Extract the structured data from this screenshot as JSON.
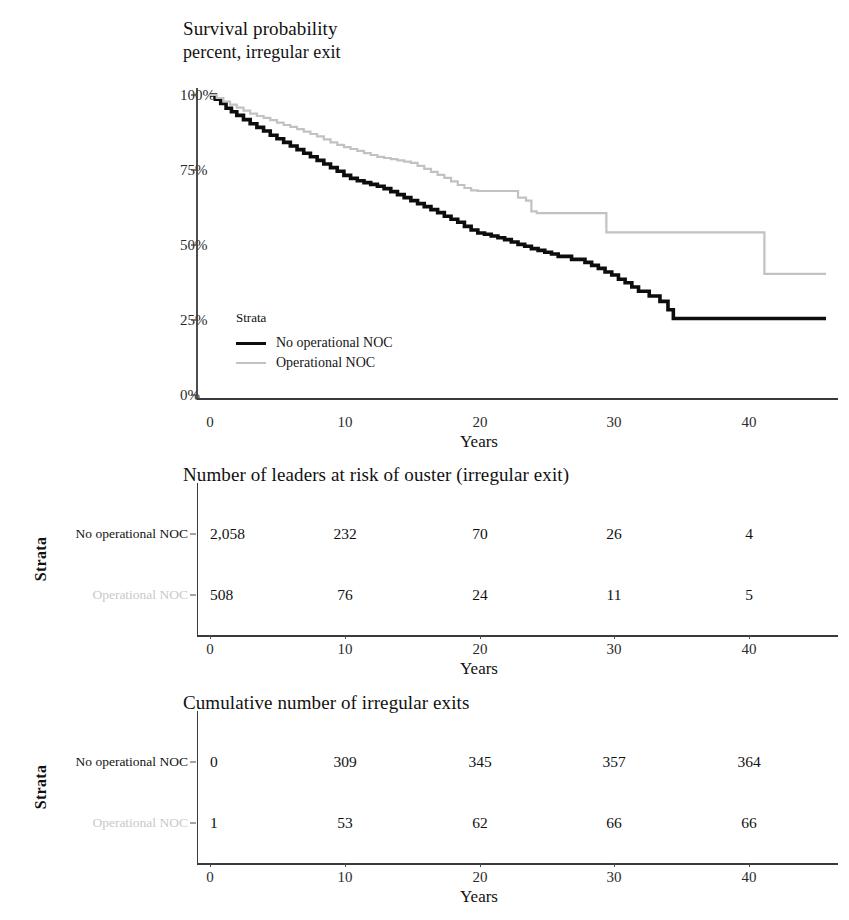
{
  "figure": {
    "background": "#ffffff",
    "series_colors": {
      "no_operational_noc": "#0d0d0d",
      "operational_noc": "#c2c2c2"
    }
  },
  "survival_panel": {
    "title_line1": "Survival probability",
    "title_line2": "percent, irregular exit",
    "x_axis_title": "Years",
    "y_ticks": [
      "100%",
      "75%",
      "50%",
      "25%",
      "0%"
    ],
    "x_ticks": [
      "0",
      "10",
      "20",
      "30",
      "40"
    ],
    "legend": {
      "title": "Strata",
      "items": [
        {
          "label": "No operational NOC",
          "color": "#0d0d0d"
        },
        {
          "label": "Operational NOC",
          "color": "#c2c2c2"
        }
      ]
    }
  },
  "risk_panel": {
    "title": "Number of leaders at risk of ouster (irregular exit)",
    "strata_axis_label": "Strata",
    "x_axis_title": "Years",
    "x_ticks": [
      "0",
      "10",
      "20",
      "30",
      "40"
    ],
    "rows": [
      {
        "label": "No operational NOC",
        "color": "#121212",
        "values": [
          "2,058",
          "232",
          "70",
          "26",
          "4"
        ]
      },
      {
        "label": "Operational NOC",
        "color": "#c9c9c9",
        "values": [
          "508",
          "76",
          "24",
          "11",
          "5"
        ]
      }
    ]
  },
  "cumulative_panel": {
    "title": "Cumulative number of irregular exits",
    "strata_axis_label": "Strata",
    "x_axis_title": "Years",
    "x_ticks": [
      "0",
      "10",
      "20",
      "30",
      "40"
    ],
    "rows": [
      {
        "label": "No operational NOC",
        "color": "#121212",
        "values": [
          "0",
          "309",
          "345",
          "357",
          "364"
        ]
      },
      {
        "label": "Operational NOC",
        "color": "#c9c9c9",
        "values": [
          "1",
          "53",
          "62",
          "66",
          "66"
        ]
      }
    ]
  },
  "chart_data": {
    "type": "line",
    "title": "Survival probability",
    "subtitle": "percent, irregular exit",
    "xlabel": "Years",
    "ylabel": "Survival probability percent, irregular exit",
    "xlim": [
      0,
      46
    ],
    "ylim": [
      0,
      100
    ],
    "xticks": [
      0,
      10,
      20,
      30,
      40
    ],
    "yticks": [
      0,
      25,
      50,
      75,
      100
    ],
    "ytick_labels": [
      "0%",
      "25%",
      "50%",
      "75%",
      "100%"
    ],
    "grid": false,
    "legend_position": "inside-lower-left",
    "legend_title": "Strata",
    "step": "post",
    "series": [
      {
        "name": "No operational NOC",
        "color": "#0d0d0d",
        "points": [
          [
            0,
            100
          ],
          [
            0.4,
            98.6
          ],
          [
            0.8,
            97.2
          ],
          [
            1.2,
            95.6
          ],
          [
            1.6,
            94.4
          ],
          [
            2.0,
            93.2
          ],
          [
            2.5,
            91.8
          ],
          [
            3.0,
            90.4
          ],
          [
            3.5,
            89.2
          ],
          [
            4.0,
            88.0
          ],
          [
            4.5,
            86.6
          ],
          [
            5.0,
            85.4
          ],
          [
            5.5,
            84.2
          ],
          [
            6.0,
            83.0
          ],
          [
            6.5,
            81.8
          ],
          [
            7.0,
            80.6
          ],
          [
            7.5,
            79.4
          ],
          [
            8.0,
            78.2
          ],
          [
            8.5,
            77.0
          ],
          [
            9.0,
            75.8
          ],
          [
            9.5,
            74.6
          ],
          [
            10.0,
            73.2
          ],
          [
            10.5,
            72.2
          ],
          [
            11.0,
            71.4
          ],
          [
            11.5,
            70.8
          ],
          [
            12.0,
            70.2
          ],
          [
            12.5,
            69.6
          ],
          [
            13.0,
            68.8
          ],
          [
            13.5,
            67.8
          ],
          [
            14.0,
            66.8
          ],
          [
            14.5,
            65.8
          ],
          [
            15.0,
            64.8
          ],
          [
            15.5,
            63.8
          ],
          [
            16.0,
            62.8
          ],
          [
            16.5,
            61.8
          ],
          [
            17.0,
            60.8
          ],
          [
            17.5,
            59.6
          ],
          [
            18.0,
            58.6
          ],
          [
            18.5,
            57.6
          ],
          [
            19.0,
            56.2
          ],
          [
            19.5,
            55.0
          ],
          [
            20.0,
            54.0
          ],
          [
            20.5,
            53.6
          ],
          [
            21.0,
            53.0
          ],
          [
            21.5,
            52.4
          ],
          [
            22.0,
            51.8
          ],
          [
            22.5,
            51.0
          ],
          [
            23.0,
            50.2
          ],
          [
            23.5,
            49.6
          ],
          [
            24.0,
            48.8
          ],
          [
            24.5,
            48.2
          ],
          [
            25.0,
            47.6
          ],
          [
            25.5,
            47.0
          ],
          [
            26.0,
            46.2
          ],
          [
            27.0,
            45.2
          ],
          [
            28.0,
            44.2
          ],
          [
            28.5,
            43.2
          ],
          [
            29.0,
            42.2
          ],
          [
            29.5,
            41.0
          ],
          [
            30.0,
            40.0
          ],
          [
            30.5,
            38.6
          ],
          [
            31.0,
            37.4
          ],
          [
            31.5,
            36.0
          ],
          [
            32.0,
            34.6
          ],
          [
            32.8,
            33.0
          ],
          [
            33.6,
            31.2
          ],
          [
            34.2,
            28.4
          ],
          [
            34.6,
            25.5
          ],
          [
            46.0,
            25.5
          ]
        ]
      },
      {
        "name": "Operational NOC",
        "color": "#c2c2c2",
        "points": [
          [
            0,
            100
          ],
          [
            0.5,
            99.0
          ],
          [
            1.0,
            97.8
          ],
          [
            1.5,
            96.8
          ],
          [
            2.0,
            95.8
          ],
          [
            2.5,
            94.8
          ],
          [
            3.0,
            93.8
          ],
          [
            3.5,
            93.0
          ],
          [
            4.0,
            92.4
          ],
          [
            4.5,
            91.6
          ],
          [
            5.0,
            90.8
          ],
          [
            5.5,
            90.0
          ],
          [
            6.0,
            89.4
          ],
          [
            6.5,
            88.6
          ],
          [
            7.0,
            87.8
          ],
          [
            7.5,
            87.0
          ],
          [
            8.0,
            86.2
          ],
          [
            8.5,
            85.2
          ],
          [
            9.0,
            84.2
          ],
          [
            9.5,
            83.4
          ],
          [
            10.0,
            82.6
          ],
          [
            10.5,
            82.0
          ],
          [
            11.0,
            81.4
          ],
          [
            11.5,
            80.6
          ],
          [
            12.0,
            80.0
          ],
          [
            12.5,
            79.4
          ],
          [
            13.0,
            79.0
          ],
          [
            13.5,
            78.6
          ],
          [
            14.0,
            78.2
          ],
          [
            14.5,
            77.8
          ],
          [
            15.0,
            77.4
          ],
          [
            15.5,
            76.4
          ],
          [
            16.0,
            75.4
          ],
          [
            16.5,
            74.4
          ],
          [
            17.0,
            73.4
          ],
          [
            17.5,
            72.4
          ],
          [
            18.0,
            71.2
          ],
          [
            18.5,
            70.0
          ],
          [
            19.0,
            69.0
          ],
          [
            19.5,
            68.2
          ],
          [
            20.0,
            68.0
          ],
          [
            22.8,
            68.0
          ],
          [
            23.0,
            65.8
          ],
          [
            23.6,
            64.8
          ],
          [
            24.0,
            61.2
          ],
          [
            24.4,
            60.6
          ],
          [
            29.2,
            60.6
          ],
          [
            29.6,
            54.2
          ],
          [
            41.0,
            54.2
          ],
          [
            41.4,
            40.4
          ],
          [
            46.0,
            40.4
          ]
        ]
      }
    ]
  }
}
